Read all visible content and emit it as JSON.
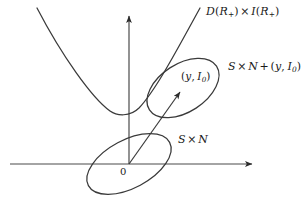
{
  "figure": {
    "kind": "mathematical-diagram",
    "width": 306,
    "height": 199,
    "background_color": "#ffffff",
    "ink_color": "#2b2b2b",
    "label_color": "#1a1a1a",
    "shade_color": "#b9b9b9"
  },
  "labels": {
    "parabola_curve": {
      "text": "D(R₊) × I(R₊)",
      "base_left": "D",
      "arg_left": "R",
      "sub_left": "+",
      "operator": "×",
      "base_right": "I",
      "arg_right": "R",
      "sub_right": "+"
    },
    "upper_ellipse": {
      "text": "S × N + (y, I₀)",
      "set_a": "S",
      "times": "×",
      "set_b": "N",
      "plus": "+",
      "point_x": "y",
      "point_y": "I",
      "point_y_sub": "0"
    },
    "point_marker": {
      "text": "(y, I₀)",
      "x_symbol": "y",
      "y_symbol": "I",
      "y_subscript": "0"
    },
    "lower_ellipse": {
      "text": "S × N",
      "set_a": "S",
      "times": "×",
      "set_b": "N"
    },
    "origin": {
      "text": "0"
    }
  },
  "geometry": {
    "x_axis": {
      "name": "horizontal-axis",
      "from": [
        10,
        164
      ],
      "to": [
        258,
        164
      ],
      "arrowhead": "right"
    },
    "y_axis": {
      "name": "vertical-axis",
      "from": [
        129,
        164
      ],
      "to": [
        129,
        10
      ],
      "arrowhead": "up"
    },
    "parabola": {
      "name": "parabola-curve",
      "vertex": [
        124,
        114
      ],
      "left_endpoint": [
        37,
        8
      ],
      "right_endpoint": [
        200,
        8
      ],
      "opens": "up"
    },
    "lower_ellipse": {
      "name": "origin-ellipse",
      "center": [
        129,
        164
      ],
      "radius_x": 46,
      "radius_y": 24,
      "rotation_deg": -28
    },
    "upper_ellipse": {
      "name": "translated-ellipse",
      "center": [
        183,
        88
      ],
      "radius_x": 40,
      "radius_y": 24,
      "rotation_deg": -33
    },
    "translation_arrow": {
      "name": "translation-vector",
      "from": [
        129,
        164
      ],
      "to": [
        183,
        88
      ],
      "arrowhead": "to"
    },
    "shaded_lens": {
      "name": "intersection-region",
      "fill": "stipple",
      "description": "region of upper ellipse left of parabola"
    }
  }
}
